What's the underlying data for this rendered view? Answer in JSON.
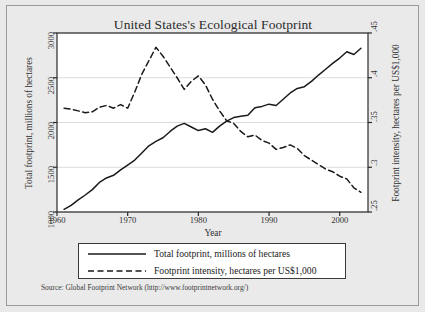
{
  "figure": {
    "title": "United States's Ecological Footprint",
    "source_note": "Source: Global Footprint Network (http://www.footprintnetwork.org/)",
    "background_color": "#e9e9e9",
    "plot_background_color": "#ffffff",
    "line_color": "#1a1a1a",
    "grid_color": "#dcdcdc"
  },
  "legend": {
    "items": [
      {
        "label": "Total footprint, millions of hectares",
        "style": "solid",
        "key_name": "legend-key-solid"
      },
      {
        "label": "Footprint intensity, hectares per US$1,000",
        "style": "dashed",
        "key_name": "legend-key-dashed"
      }
    ]
  },
  "chart_data": {
    "type": "line",
    "title": "United States's Ecological Footprint",
    "xlabel": "Year",
    "ylabel": "Total footprint, millions of hectares",
    "ylabel_right": "Footprint intensity, hectares per US$1,000",
    "xlim": [
      1960,
      2004
    ],
    "ylim": [
      1000,
      3000
    ],
    "ylim_right": [
      0.25,
      0.45
    ],
    "xticks": [
      1960,
      1970,
      1980,
      1990,
      2000
    ],
    "xtick_labels": [
      "1960",
      "1970",
      "1980",
      "1990",
      "2000"
    ],
    "yticks": [
      1000,
      1500,
      2000,
      2500,
      3000
    ],
    "ytick_labels": [
      "1000",
      "1500",
      "2000",
      "2500",
      "3000"
    ],
    "yticks_right": [
      0.25,
      0.3,
      0.35,
      0.4,
      0.45
    ],
    "ytick_labels_right": [
      ".25",
      ".3",
      ".35",
      ".4",
      ".45"
    ],
    "grid": true,
    "legend_position": "below-axes",
    "x": [
      1961,
      1962,
      1963,
      1964,
      1965,
      1966,
      1967,
      1968,
      1969,
      1970,
      1971,
      1972,
      1973,
      1974,
      1975,
      1976,
      1977,
      1978,
      1979,
      1980,
      1981,
      1982,
      1983,
      1984,
      1985,
      1986,
      1987,
      1988,
      1989,
      1990,
      1991,
      1992,
      1993,
      1994,
      1995,
      1996,
      1997,
      1998,
      1999,
      2000,
      2001,
      2002,
      2003
    ],
    "series": [
      {
        "name": "Total footprint, millions of hectares",
        "style": "solid",
        "axis": "left",
        "units": "millions of hectares",
        "values": [
          1030,
          1075,
          1135,
          1190,
          1250,
          1330,
          1380,
          1410,
          1470,
          1525,
          1580,
          1660,
          1740,
          1790,
          1830,
          1900,
          1960,
          1990,
          1950,
          1910,
          1930,
          1890,
          1960,
          2015,
          2055,
          2070,
          2080,
          2165,
          2180,
          2205,
          2190,
          2260,
          2330,
          2380,
          2400,
          2460,
          2530,
          2595,
          2660,
          2720,
          2790,
          2760,
          2830
        ]
      },
      {
        "name": "Footprint intensity, hectares per US$1,000",
        "style": "dashed",
        "axis": "right",
        "units": "hectares per US$1,000",
        "values": [
          0.366,
          0.365,
          0.363,
          0.361,
          0.362,
          0.367,
          0.369,
          0.366,
          0.37,
          0.366,
          0.384,
          0.404,
          0.419,
          0.434,
          0.424,
          0.412,
          0.4,
          0.387,
          0.396,
          0.402,
          0.392,
          0.376,
          0.363,
          0.352,
          0.349,
          0.34,
          0.334,
          0.336,
          0.33,
          0.327,
          0.32,
          0.322,
          0.325,
          0.321,
          0.313,
          0.308,
          0.303,
          0.298,
          0.295,
          0.29,
          0.287,
          0.277,
          0.272
        ]
      }
    ]
  }
}
